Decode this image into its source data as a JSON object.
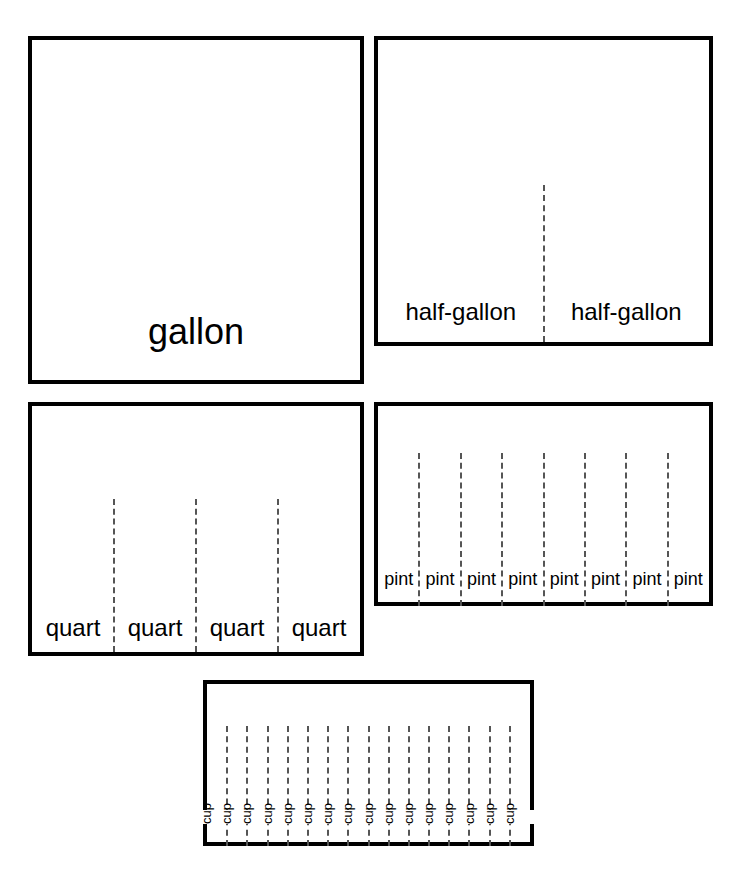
{
  "page": {
    "clipped_header_text": "",
    "background_color": "#ffffff",
    "line_color": "#000000",
    "divider_color": "#555555"
  },
  "chart_data": {
    "type": "diagram",
    "rows": [
      {
        "id": "gallon",
        "label": "gallon",
        "count": 1,
        "cells": [
          "gallon"
        ],
        "dividers": 0,
        "orientation": "horizontal"
      },
      {
        "id": "half-gallon",
        "label": "half-gallon",
        "count": 2,
        "cells": [
          "half-gallon",
          "half-gallon"
        ],
        "dividers": 1,
        "orientation": "horizontal"
      },
      {
        "id": "quart",
        "label": "quart",
        "count": 4,
        "cells": [
          "quart",
          "quart",
          "quart",
          "quart"
        ],
        "dividers": 3,
        "orientation": "horizontal"
      },
      {
        "id": "pint",
        "label": "pint",
        "count": 8,
        "cells": [
          "pint",
          "pint",
          "pint",
          "pint",
          "pint",
          "pint",
          "pint",
          "pint"
        ],
        "dividers": 7,
        "orientation": "horizontal"
      },
      {
        "id": "cup",
        "label": "cup",
        "count": 16,
        "cells": [
          "cup",
          "cup",
          "cup",
          "cup",
          "cup",
          "cup",
          "cup",
          "cup",
          "cup",
          "cup",
          "cup",
          "cup",
          "cup",
          "cup",
          "cup",
          "cup"
        ],
        "dividers": 15,
        "orientation": "vertical"
      }
    ]
  }
}
